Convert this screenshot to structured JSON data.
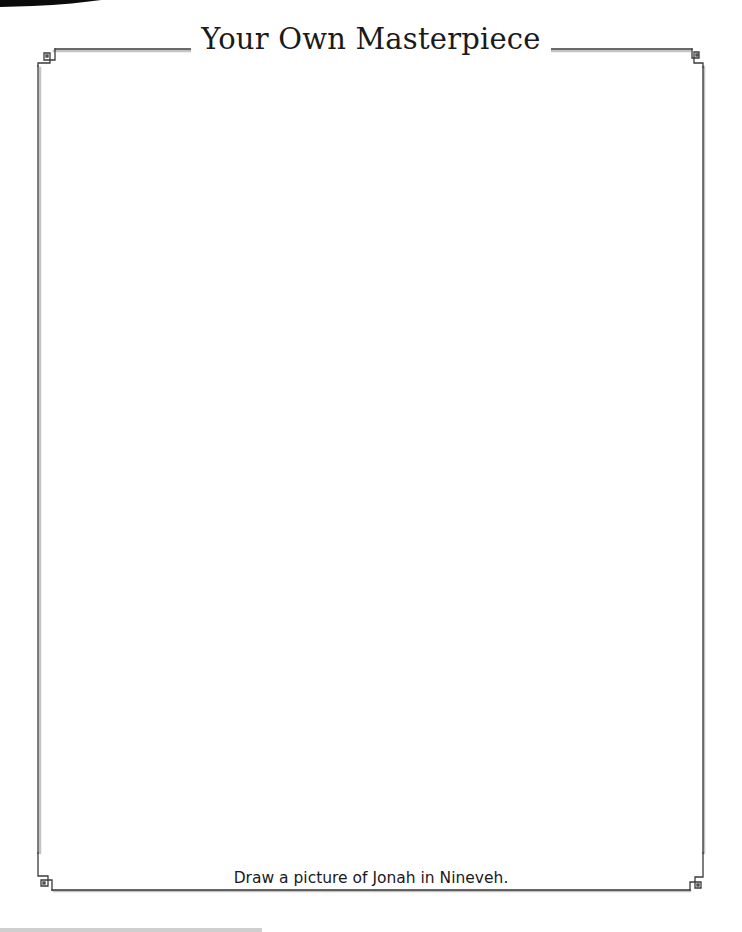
{
  "page": {
    "title": "Your Own Masterpiece",
    "instruction": "Draw a picture of Jonah in Nineveh."
  },
  "frame": {
    "line_color": "#3a3a3a",
    "shadow_color": "#bdbdbd",
    "corner_ornament": "square-key-ornament"
  }
}
